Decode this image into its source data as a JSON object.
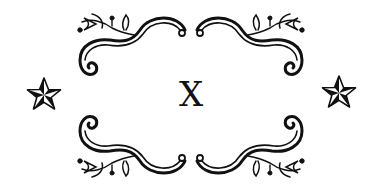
{
  "ornament": {
    "center_text": "X",
    "ink_color": "#111111",
    "background": "#ffffff",
    "left_star": "nautical-star",
    "right_star": "nautical-star"
  }
}
